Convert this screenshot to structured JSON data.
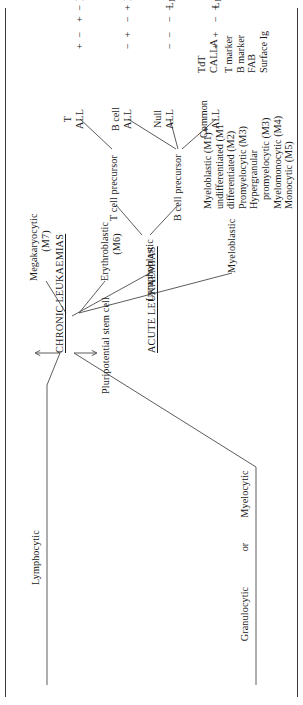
{
  "figure": {
    "type": "classification-flowchart",
    "orientation": "rotated-90-ccw",
    "domain": "haematology",
    "lineage_headings": {
      "lymphoid": "Lymphocytic",
      "myeloid_line1": "Granulocytic",
      "myeloid_line2": "or",
      "myeloid_line3": "Myelocytic"
    },
    "origin": {
      "stem_cell": "Pluripotential stem cell",
      "chronic": "CHRONIC LEUKAEMIAS",
      "acute": "ACUTE LEUKAEMIAS"
    },
    "branches": {
      "lymphoblastic": "Lymphoblastic",
      "t_cell_precursor": "T cell precursor",
      "b_cell_precursor": "B cell precursor",
      "megakaryocytic_l1": "Megakaryocytic",
      "megakaryocytic_l2": "(M7)",
      "erythroblastic_l1": "Erythroblastic",
      "erythroblastic_l2": "(M6)",
      "myeloblastic": "Myeloblastic"
    },
    "fab_myeloid_subtypes": [
      {
        "text": "Myeloblastic (M1)*",
        "indent": false
      },
      {
        "text": "undifferentiated (M1",
        "indent": false
      },
      {
        "text": "differentiated (M2)",
        "indent": false
      },
      {
        "text": "Promyelocytic (M3)",
        "indent": false
      },
      {
        "text": "Hypergranular",
        "indent": false
      },
      {
        "text": "promyelocytic (M3)",
        "indent": true
      },
      {
        "text": "Myelomonocytic (M4)",
        "indent": false
      },
      {
        "text": "Monocytic (M5)",
        "indent": false
      }
    ],
    "marker_table": {
      "row_labels_group1": [
        "TdT",
        "CALLA"
      ],
      "row_labels_group2": [
        "T marker",
        "B marker",
        "FAB",
        "Surface Ig"
      ],
      "columns": [
        {
          "header_line1": "Common",
          "header_line2": "ALL"
        },
        {
          "header_line1": "Null",
          "header_line2": "ALL"
        },
        {
          "header_line1": "B cell",
          "header_line2": "ALL"
        },
        {
          "header_line1": "T",
          "header_line2": "ALL"
        }
      ],
      "rows": [
        {
          "label": "TdT",
          "values": [
            "+",
            "−",
            "−",
            "+"
          ]
        },
        {
          "label": "CALLA",
          "values": [
            "+",
            "−",
            "+",
            "−"
          ]
        },
        {
          "label": "T marker",
          "values": [
            "−",
            "−",
            "−",
            "+"
          ]
        },
        {
          "label": "B marker",
          "values": [
            "+",
            "−",
            "+",
            "−"
          ]
        },
        {
          "label": "FAB",
          "values": [
            "L1, L2",
            "L1, L2",
            "L3",
            "L2"
          ]
        },
        {
          "label": "Surface Ig",
          "values": [
            "−",
            "−",
            "+",
            "−"
          ]
        }
      ]
    },
    "colors": {
      "ink": "#1a1a1a",
      "rule": "#3a3a3a",
      "connector": "#4a4a4a",
      "page": "#ffffff"
    }
  }
}
